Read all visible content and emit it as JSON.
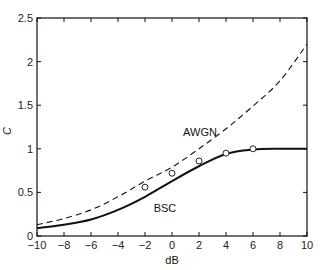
{
  "chart_data": {
    "type": "line",
    "title": "",
    "xlabel": "dB",
    "ylabel": "C",
    "xlim": [
      -10,
      10
    ],
    "ylim": [
      0,
      2.5
    ],
    "grid": false,
    "xticks": [
      "-10",
      "-8",
      "-6",
      "-4",
      "-2",
      "0",
      "2",
      "4",
      "6",
      "8",
      "10"
    ],
    "yticks": [
      "0",
      "0.5",
      "1",
      "1.5",
      "2",
      "2.5"
    ],
    "series": [
      {
        "name": "AWGN",
        "style": "dashed",
        "x": [
          -10,
          -8,
          -6,
          -4,
          -2,
          0,
          2,
          4,
          6,
          8,
          10
        ],
        "values": [
          0.13,
          0.2,
          0.3,
          0.45,
          0.63,
          0.79,
          1.0,
          1.23,
          1.49,
          1.78,
          2.2
        ]
      },
      {
        "name": "BSC",
        "style": "solid",
        "x": [
          -10,
          -8,
          -6,
          -4,
          -2,
          0,
          2,
          4,
          6,
          8,
          10
        ],
        "values": [
          0.09,
          0.13,
          0.19,
          0.3,
          0.45,
          0.63,
          0.8,
          0.94,
          0.99,
          1.0,
          1.0
        ]
      },
      {
        "name": "markers",
        "style": "circle",
        "x": [
          -2,
          0,
          2,
          4,
          6
        ],
        "values": [
          0.56,
          0.72,
          0.86,
          0.95,
          1.0
        ]
      }
    ],
    "annotations": [
      {
        "text": "AWGN",
        "x": 1.6,
        "y": 1.1
      },
      {
        "text": "BSC",
        "x": -0.6,
        "y": 0.4
      }
    ]
  }
}
